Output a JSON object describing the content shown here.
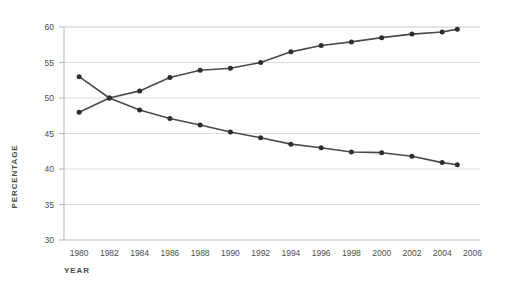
{
  "chart_data": {
    "type": "line",
    "title": "",
    "xlabel": "YEAR",
    "ylabel": "PERCENTAGE",
    "xlim": [
      1979,
      2006.5
    ],
    "ylim": [
      30,
      60
    ],
    "grid": true,
    "legend": "none",
    "xticks": [
      1980,
      1982,
      1984,
      1986,
      1988,
      1990,
      1992,
      1994,
      1996,
      1998,
      2000,
      2002,
      2004,
      2006
    ],
    "yticks": [
      30,
      35,
      40,
      45,
      50,
      55,
      60
    ],
    "x": [
      1980,
      1982,
      1984,
      1986,
      1988,
      1990,
      1992,
      1994,
      1996,
      1998,
      2000,
      2002,
      2004,
      2005
    ],
    "series": [
      {
        "name": "rising-series",
        "color": "#4a4a4a",
        "values": [
          48.0,
          50.0,
          51.0,
          52.9,
          53.9,
          54.2,
          55.0,
          56.5,
          57.4,
          57.9,
          58.5,
          59.0,
          59.3,
          59.7
        ]
      },
      {
        "name": "declining-series",
        "color": "#4a4a4a",
        "values": [
          53.0,
          50.0,
          48.3,
          47.1,
          46.2,
          45.2,
          44.4,
          43.5,
          43.0,
          42.4,
          42.3,
          41.8,
          40.9,
          40.6
        ]
      }
    ]
  },
  "axes": {
    "ylabel_text": "PERCENTAGE",
    "xlabel_text": "YEAR"
  },
  "colors": {
    "line": "#4a4a4a",
    "marker": "#2e2e2e",
    "grid": "#dcdcdc",
    "axis": "#b4b4b4",
    "background": "#ffffff"
  }
}
